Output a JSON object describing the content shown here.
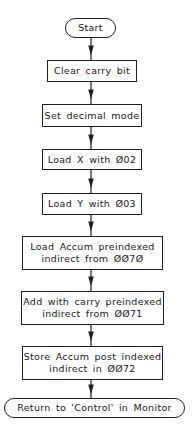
{
  "flowchart": {
    "nodes": [
      {
        "id": "start",
        "type": "terminal",
        "lines": [
          "Start"
        ]
      },
      {
        "id": "clear-carry",
        "type": "process",
        "lines": [
          "Clear carry bit"
        ]
      },
      {
        "id": "set-decimal",
        "type": "process",
        "lines": [
          "Set decimal mode"
        ]
      },
      {
        "id": "load-x",
        "type": "process",
        "lines": [
          "Load X with Ø02"
        ]
      },
      {
        "id": "load-y",
        "type": "process",
        "lines": [
          "Load Y with Ø03"
        ]
      },
      {
        "id": "load-accum",
        "type": "process",
        "lines": [
          "Load Accum preindexed",
          "indirect from ØØ7Ø"
        ]
      },
      {
        "id": "add-carry",
        "type": "process",
        "lines": [
          "Add with carry preindexed",
          "indirect from ØØ71"
        ]
      },
      {
        "id": "store-accum",
        "type": "process",
        "lines": [
          "Store Accum post indexed",
          "indirect in ØØ72"
        ]
      },
      {
        "id": "return",
        "type": "terminal",
        "lines": [
          "Return to 'Control' in Monitor"
        ]
      }
    ],
    "edges": [
      [
        "start",
        "clear-carry"
      ],
      [
        "clear-carry",
        "set-decimal"
      ],
      [
        "set-decimal",
        "load-x"
      ],
      [
        "load-x",
        "load-y"
      ],
      [
        "load-y",
        "load-accum"
      ],
      [
        "load-accum",
        "add-carry"
      ],
      [
        "add-carry",
        "store-accum"
      ],
      [
        "store-accum",
        "return"
      ]
    ]
  }
}
